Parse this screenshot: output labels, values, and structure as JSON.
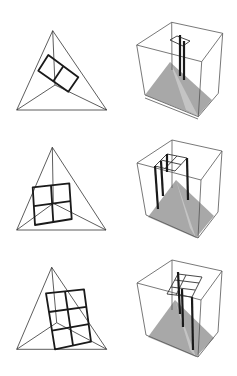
{
  "figure": {
    "background": "#ffffff",
    "line_color": "#333333",
    "fill_grey": "#a8a8a8",
    "rows": [
      {
        "label": "",
        "grid_size": "1x2",
        "poles": 2
      },
      {
        "label": "",
        "grid_size": "2x2",
        "poles": 4
      },
      {
        "label": "",
        "grid_size": "2x3",
        "poles": 3
      }
    ]
  }
}
